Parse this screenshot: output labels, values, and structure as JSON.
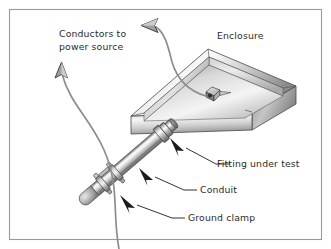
{
  "figure": {
    "width": 331,
    "height": 249,
    "background_color": "#ffffff",
    "border_color": "#9a9a9a"
  },
  "labels": {
    "conductors": {
      "line1": "Conductors to",
      "line2": "power source"
    },
    "enclosure": "Enclosure",
    "fitting": "Fitting under test",
    "conduit": "Conduit",
    "ground_clamp": "Ground clamp"
  },
  "colors": {
    "text": "#2b2b2b",
    "wire": "#8d8d8d",
    "arrow_black": "#1c1c1c",
    "arrow_gray_fill": "#a0a0a0",
    "arrow_gray_stroke": "#3a3a3a",
    "metal_light": "#f2f2f2",
    "metal_mid": "#b8b8b8",
    "metal_dark": "#767676",
    "outline": "#4a4a4a"
  },
  "parts": [
    {
      "name": "enclosure",
      "description": "open-top rectangular metal enclosure in isometric view"
    },
    {
      "name": "fitting",
      "description": "conduit fitting passing through enclosure wall"
    },
    {
      "name": "conduit",
      "description": "cylindrical metal conduit running diagonally"
    },
    {
      "name": "ground-clamp",
      "description": "banded ground clamp with bolts near conduit end"
    },
    {
      "name": "terminal-connector",
      "description": "small cube connector inside enclosure"
    },
    {
      "name": "conductor-wire-box",
      "description": "wire exiting enclosure curving up and left"
    },
    {
      "name": "conductor-wire-conduit",
      "description": "wire from conduit curving up and left"
    }
  ]
}
